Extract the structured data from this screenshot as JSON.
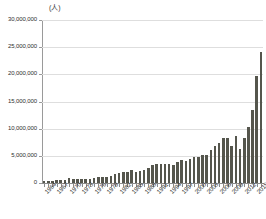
{
  "chart_data": {
    "type": "bar",
    "title": "",
    "subtitle": "",
    "unit_label": "(人)",
    "xlabel": "",
    "ylabel": "",
    "ylim": [
      0,
      30000000
    ],
    "ytick_labels": [
      "30,000,000",
      "25,000,000",
      "20,000,000",
      "15,000,000",
      "10,000,000",
      "5,000,000",
      "0"
    ],
    "ytick_values": [
      30000000,
      25000000,
      20000000,
      15000000,
      10000000,
      5000000,
      0
    ],
    "grid": true,
    "legend": "none",
    "bar_color": "#55564d",
    "xtick_label_interval": 3,
    "xtick_labels_shown": [
      "1964",
      "1967",
      "1970",
      "1973",
      "1976",
      "1979",
      "1982",
      "1985",
      "1988",
      "1991",
      "1994",
      "1997",
      "2000",
      "2003",
      "2006",
      "2009",
      "2012",
      "2015"
    ],
    "categories": [
      "1964",
      "1965",
      "1966",
      "1967",
      "1968",
      "1969",
      "1970",
      "1971",
      "1972",
      "1973",
      "1974",
      "1975",
      "1976",
      "1977",
      "1978",
      "1979",
      "1980",
      "1981",
      "1982",
      "1983",
      "1984",
      "1985",
      "1986",
      "1987",
      "1988",
      "1989",
      "1990",
      "1991",
      "1992",
      "1993",
      "1994",
      "1995",
      "1996",
      "1997",
      "1998",
      "1999",
      "2000",
      "2001",
      "2002",
      "2003",
      "2004",
      "2005",
      "2006",
      "2007",
      "2008",
      "2009",
      "2010",
      "2011",
      "2012",
      "2013",
      "2014",
      "2015",
      "2016"
    ],
    "values": [
      352832,
      366649,
      432971,
      477000,
      519000,
      608000,
      854419,
      660715,
      724000,
      784000,
      765000,
      812000,
      915000,
      1030000,
      1039000,
      1113000,
      1317000,
      1583000,
      1793000,
      1968000,
      2110000,
      2327000,
      2061000,
      2155000,
      2355000,
      2835000,
      3235000,
      3533000,
      3581000,
      3410000,
      3468000,
      3345000,
      3837000,
      4218000,
      4106000,
      4438000,
      4757000,
      4772000,
      5239000,
      5212000,
      6138000,
      6728000,
      7334000,
      8347000,
      8351000,
      6790000,
      8611000,
      6219000,
      8358000,
      10364000,
      13413000,
      19737000,
      24040000
    ]
  }
}
